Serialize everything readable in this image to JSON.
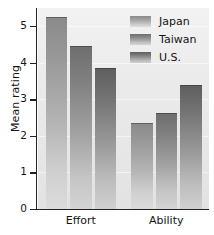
{
  "chart_data": {
    "type": "bar",
    "title": "",
    "xlabel": "",
    "ylabel": "Mean rating",
    "categories": [
      "Effort",
      "Ability"
    ],
    "series": [
      {
        "name": "Japan",
        "values": [
          5.25,
          2.35
        ],
        "color": "#9b9b9b"
      },
      {
        "name": "Taiwan",
        "values": [
          4.45,
          2.62
        ],
        "color": "#868686"
      },
      {
        "name": "U.S.",
        "values": [
          3.85,
          3.4
        ],
        "color": "#767676"
      }
    ],
    "ylim": [
      0,
      5.5
    ],
    "yticks": [
      "0",
      "1",
      "2",
      "3",
      "4",
      "5"
    ],
    "ytick_values": [
      0,
      1,
      2,
      3,
      4,
      5
    ],
    "grid": true,
    "legend_position": "top-right"
  },
  "axes": {
    "y_label": "Mean rating",
    "y_ticks": [
      "0",
      "1",
      "2",
      "3",
      "4",
      "5"
    ],
    "x_ticks": [
      "Effort",
      "Ability"
    ]
  },
  "legend": {
    "entries": [
      {
        "label": "Japan"
      },
      {
        "label": "Taiwan"
      },
      {
        "label": "U.S."
      }
    ]
  }
}
